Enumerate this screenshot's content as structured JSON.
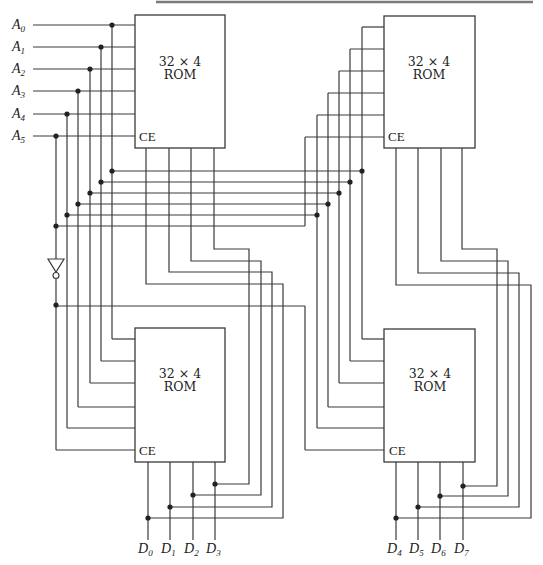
{
  "diagram": {
    "title": "",
    "roms": [
      {
        "id": "rom-top-left",
        "label_line1": "32 × 4",
        "label_line2": "ROM",
        "ce_label": "CE"
      },
      {
        "id": "rom-top-right",
        "label_line1": "32 × 4",
        "label_line2": "ROM",
        "ce_label": "CE"
      },
      {
        "id": "rom-bottom-left",
        "label_line1": "32 × 4",
        "label_line2": "ROM",
        "ce_label": "CE"
      },
      {
        "id": "rom-bottom-right",
        "label_line1": "32 × 4",
        "label_line2": "ROM",
        "ce_label": "CE"
      }
    ],
    "address_inputs": [
      {
        "base": "A",
        "sub": "0"
      },
      {
        "base": "A",
        "sub": "1"
      },
      {
        "base": "A",
        "sub": "2"
      },
      {
        "base": "A",
        "sub": "3"
      },
      {
        "base": "A",
        "sub": "4"
      },
      {
        "base": "A",
        "sub": "5"
      }
    ],
    "data_outputs": [
      {
        "base": "D",
        "sub": "0"
      },
      {
        "base": "D",
        "sub": "1"
      },
      {
        "base": "D",
        "sub": "2"
      },
      {
        "base": "D",
        "sub": "3"
      },
      {
        "base": "D",
        "sub": "4"
      },
      {
        "base": "D",
        "sub": "5"
      },
      {
        "base": "D",
        "sub": "6"
      },
      {
        "base": "D",
        "sub": "7"
      }
    ],
    "inverter": {
      "name": "NOT gate on A5"
    }
  }
}
